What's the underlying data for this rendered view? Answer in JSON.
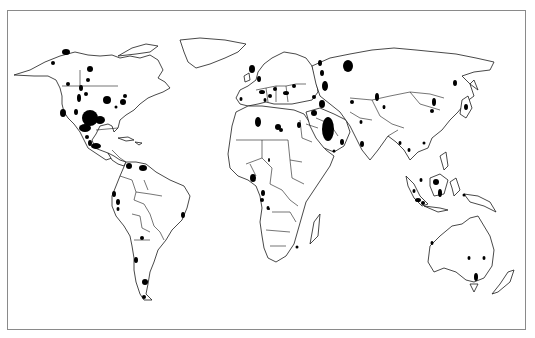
{
  "map": {
    "type": "world outline map with marked regions",
    "frame": {
      "x": 7,
      "y": 10,
      "width": 519,
      "height": 320,
      "color": "#8a8a8a"
    },
    "marker_color": "#000000",
    "outline_color": "#1a1a1a",
    "markers": [
      {
        "region": "Alaska",
        "cx": 66,
        "cy": 52,
        "rx": 4,
        "ry": 3
      },
      {
        "region": "Alaska-west",
        "cx": 53,
        "cy": 63,
        "rx": 2,
        "ry": 2
      },
      {
        "region": "Canada-west-1",
        "cx": 90,
        "cy": 69,
        "rx": 3,
        "ry": 3
      },
      {
        "region": "Canada-west-2",
        "cx": 88,
        "cy": 80,
        "rx": 2,
        "ry": 2
      },
      {
        "region": "Canada-west-3",
        "cx": 86,
        "cy": 94,
        "rx": 2,
        "ry": 2
      },
      {
        "region": "Canada-BC",
        "cx": 68,
        "cy": 84,
        "rx": 2,
        "ry": 2
      },
      {
        "region": "Rockies-1",
        "cx": 81,
        "cy": 88,
        "rx": 2,
        "ry": 3
      },
      {
        "region": "Rockies-2",
        "cx": 79,
        "cy": 98,
        "rx": 2,
        "ry": 4
      },
      {
        "region": "Rockies-3",
        "cx": 76,
        "cy": 112,
        "rx": 2,
        "ry": 3
      },
      {
        "region": "California",
        "cx": 63,
        "cy": 113,
        "rx": 3,
        "ry": 4
      },
      {
        "region": "Midwest",
        "cx": 107,
        "cy": 100,
        "rx": 4,
        "ry": 4
      },
      {
        "region": "Great Lakes-1",
        "cx": 125,
        "cy": 96,
        "rx": 2,
        "ry": 2
      },
      {
        "region": "Great Lakes-2",
        "cx": 123,
        "cy": 102,
        "rx": 3,
        "ry": 3
      },
      {
        "region": "Appalachia",
        "cx": 116,
        "cy": 107,
        "rx": 1.5,
        "ry": 1.5
      },
      {
        "region": "Texas-Oklahoma",
        "cx": 90,
        "cy": 118,
        "rx": 8,
        "ry": 8
      },
      {
        "region": "Texas-Gulf",
        "cx": 100,
        "cy": 120,
        "rx": 5,
        "ry": 4
      },
      {
        "region": "Gulf coast",
        "cx": 85,
        "cy": 128,
        "rx": 6,
        "ry": 4
      },
      {
        "region": "Mexico-1",
        "cx": 87,
        "cy": 137,
        "rx": 2,
        "ry": 2
      },
      {
        "region": "Mexico-2",
        "cx": 90,
        "cy": 143,
        "rx": 2,
        "ry": 3
      },
      {
        "region": "Mexico-Gulf",
        "cx": 96,
        "cy": 146,
        "rx": 5,
        "ry": 3
      },
      {
        "region": "Colombia",
        "cx": 129,
        "cy": 166,
        "rx": 3,
        "ry": 3
      },
      {
        "region": "Venezuela",
        "cx": 143,
        "cy": 168,
        "rx": 4,
        "ry": 3
      },
      {
        "region": "Ecuador",
        "cx": 114,
        "cy": 194,
        "rx": 2,
        "ry": 3
      },
      {
        "region": "Peru-1",
        "cx": 118,
        "cy": 202,
        "rx": 2,
        "ry": 3
      },
      {
        "region": "Peru-2",
        "cx": 118,
        "cy": 209,
        "rx": 1.5,
        "ry": 2
      },
      {
        "region": "Brazil-east",
        "cx": 183,
        "cy": 215,
        "rx": 2,
        "ry": 3
      },
      {
        "region": "Bolivia-Argentina",
        "cx": 142,
        "cy": 238,
        "rx": 2,
        "ry": 2
      },
      {
        "region": "Argentina-west",
        "cx": 136,
        "cy": 260,
        "rx": 2,
        "ry": 3
      },
      {
        "region": "Patagonia",
        "cx": 145,
        "cy": 282,
        "rx": 3,
        "ry": 3
      },
      {
        "region": "Tierra del Fuego",
        "cx": 144,
        "cy": 297,
        "rx": 2,
        "ry": 2
      },
      {
        "region": "North Sea",
        "cx": 252,
        "cy": 69,
        "rx": 3,
        "ry": 4
      },
      {
        "region": "Netherlands",
        "cx": 259,
        "cy": 79,
        "rx": 2,
        "ry": 3
      },
      {
        "region": "Germany",
        "cx": 262,
        "cy": 92,
        "rx": 3,
        "ry": 2
      },
      {
        "region": "Poland",
        "cx": 275,
        "cy": 89,
        "rx": 2,
        "ry": 2
      },
      {
        "region": "Romania",
        "cx": 286,
        "cy": 93,
        "rx": 3,
        "ry": 2
      },
      {
        "region": "Ukraine",
        "cx": 294,
        "cy": 86,
        "rx": 2,
        "ry": 2
      },
      {
        "region": "Italy",
        "cx": 265,
        "cy": 100,
        "rx": 1.5,
        "ry": 2
      },
      {
        "region": "Spain",
        "cx": 241,
        "cy": 99,
        "rx": 1.5,
        "ry": 2
      },
      {
        "region": "Austria",
        "cx": 270,
        "cy": 96,
        "rx": 2,
        "ry": 2
      },
      {
        "region": "Algeria",
        "cx": 258,
        "cy": 122,
        "rx": 3,
        "ry": 5
      },
      {
        "region": "Libya-1",
        "cx": 278,
        "cy": 127,
        "rx": 3,
        "ry": 3
      },
      {
        "region": "Libya-2",
        "cx": 281,
        "cy": 130,
        "rx": 2,
        "ry": 2
      },
      {
        "region": "Egypt",
        "cx": 299,
        "cy": 125,
        "rx": 2,
        "ry": 3
      },
      {
        "region": "Volga-1",
        "cx": 320,
        "cy": 63,
        "rx": 2,
        "ry": 3
      },
      {
        "region": "Volga-2",
        "cx": 322,
        "cy": 73,
        "rx": 2,
        "ry": 3
      },
      {
        "region": "Volga-3",
        "cx": 325,
        "cy": 86,
        "rx": 3,
        "ry": 5
      },
      {
        "region": "Caspian-north",
        "cx": 322,
        "cy": 104,
        "rx": 3,
        "ry": 4
      },
      {
        "region": "Caucasus",
        "cx": 314,
        "cy": 97,
        "rx": 2,
        "ry": 2
      },
      {
        "region": "West Siberia",
        "cx": 348,
        "cy": 66,
        "rx": 5,
        "ry": 6
      },
      {
        "region": "Turkmenistan",
        "cx": 352,
        "cy": 102,
        "rx": 2,
        "ry": 2
      },
      {
        "region": "Iraq-Syria",
        "cx": 314,
        "cy": 113,
        "rx": 3,
        "ry": 3
      },
      {
        "region": "Persian Gulf",
        "cx": 328,
        "cy": 129,
        "rx": 6,
        "ry": 12
      },
      {
        "region": "Oman",
        "cx": 342,
        "cy": 142,
        "rx": 2,
        "ry": 3
      },
      {
        "region": "Yemen",
        "cx": 334,
        "cy": 151,
        "rx": 1.5,
        "ry": 1.5
      },
      {
        "region": "Pakistan",
        "cx": 361,
        "cy": 122,
        "rx": 1.5,
        "ry": 2
      },
      {
        "region": "India-west",
        "cx": 362,
        "cy": 144,
        "rx": 2,
        "ry": 3
      },
      {
        "region": "Xinjiang-1",
        "cx": 377,
        "cy": 97,
        "rx": 2,
        "ry": 4
      },
      {
        "region": "Xinjiang-2",
        "cx": 384,
        "cy": 107,
        "rx": 1.5,
        "ry": 2
      },
      {
        "region": "Tarim",
        "cx": 384,
        "cy": 108,
        "rx": 1,
        "ry": 1
      },
      {
        "region": "China-north-1",
        "cx": 434,
        "cy": 102,
        "rx": 2,
        "ry": 4
      },
      {
        "region": "China-north-2",
        "cx": 432,
        "cy": 111,
        "rx": 2,
        "ry": 2
      },
      {
        "region": "Manchuria",
        "cx": 455,
        "cy": 83,
        "rx": 2,
        "ry": 3
      },
      {
        "region": "Sakhalin-Japan",
        "cx": 466,
        "cy": 107,
        "rx": 2,
        "ry": 3
      },
      {
        "region": "Myanmar",
        "cx": 400,
        "cy": 143,
        "rx": 1.5,
        "ry": 2
      },
      {
        "region": "Thailand",
        "cx": 409,
        "cy": 150,
        "rx": 1.5,
        "ry": 2
      },
      {
        "region": "Vietnam",
        "cx": 424,
        "cy": 143,
        "rx": 1.5,
        "ry": 1.5
      },
      {
        "region": "Malaysia",
        "cx": 421,
        "cy": 180,
        "rx": 1.5,
        "ry": 2
      },
      {
        "region": "Borneo-1",
        "cx": 436,
        "cy": 182,
        "rx": 3,
        "ry": 3
      },
      {
        "region": "Borneo-2",
        "cx": 440,
        "cy": 193,
        "rx": 2,
        "ry": 4
      },
      {
        "region": "Sumatra-1",
        "cx": 414,
        "cy": 191,
        "rx": 1.5,
        "ry": 2
      },
      {
        "region": "Sumatra-2",
        "cx": 418,
        "cy": 200,
        "rx": 3,
        "ry": 2
      },
      {
        "region": "Java",
        "cx": 423,
        "cy": 203,
        "rx": 2,
        "ry": 2
      },
      {
        "region": "Sulawesi",
        "cx": 464,
        "cy": 195,
        "rx": 1.5,
        "ry": 1.5
      },
      {
        "region": "West Africa-Nigeria",
        "cx": 253,
        "cy": 178,
        "rx": 3,
        "ry": 4
      },
      {
        "region": "Gabon",
        "cx": 263,
        "cy": 193,
        "rx": 2,
        "ry": 3
      },
      {
        "region": "Congo coast",
        "cx": 262,
        "cy": 200,
        "rx": 2,
        "ry": 2
      },
      {
        "region": "Angola",
        "cx": 268,
        "cy": 208,
        "rx": 1.5,
        "ry": 2
      },
      {
        "region": "Angola-2",
        "cx": 269,
        "cy": 209,
        "rx": 1,
        "ry": 1
      },
      {
        "region": "Sudan",
        "cx": 269,
        "cy": 160,
        "rx": 1,
        "ry": 2
      },
      {
        "region": "Mozambique",
        "cx": 297,
        "cy": 247,
        "rx": 1.5,
        "ry": 1.5
      },
      {
        "region": "Australia-NW",
        "cx": 432,
        "cy": 243,
        "rx": 1.5,
        "ry": 2
      },
      {
        "region": "Australia-central-1",
        "cx": 469,
        "cy": 258,
        "rx": 1.5,
        "ry": 2
      },
      {
        "region": "Australia-central-2",
        "cx": 484,
        "cy": 258,
        "rx": 1.5,
        "ry": 2
      },
      {
        "region": "Bass Strait",
        "cx": 476,
        "cy": 277,
        "rx": 2,
        "ry": 4
      }
    ]
  }
}
